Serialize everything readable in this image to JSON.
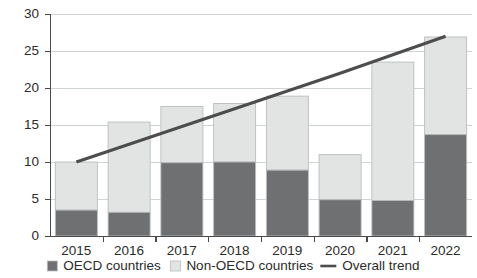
{
  "chart_data": {
    "type": "bar",
    "subtype": "stacked-bar-with-line",
    "title": "",
    "xlabel": "",
    "ylabel": "",
    "categories": [
      "2015",
      "2016",
      "2017",
      "2018",
      "2019",
      "2020",
      "2021",
      "2022"
    ],
    "series": [
      {
        "name": "OECD countries",
        "color": "#6e7072",
        "stack": "total",
        "values": [
          3.5,
          3.2,
          9.9,
          10.0,
          8.9,
          4.9,
          4.8,
          13.7
        ]
      },
      {
        "name": "Non-OECD countries",
        "color": "#e2e4e3",
        "stack": "total",
        "values": [
          6.5,
          12.2,
          7.6,
          7.9,
          10.0,
          6.1,
          18.7,
          13.2
        ]
      },
      {
        "name": "Overall trend",
        "type": "line",
        "color": "#4d4d4d",
        "values": [
          10.0,
          12.4,
          14.8,
          17.2,
          19.6,
          22.0,
          24.5,
          27.0
        ]
      }
    ],
    "totals": [
      10.0,
      15.4,
      17.5,
      17.9,
      18.9,
      11.0,
      23.5,
      26.9
    ],
    "yticks": [
      0,
      5,
      10,
      15,
      20,
      25,
      30
    ],
    "ytick_labels": [
      "0",
      "5",
      "10",
      "15",
      "20",
      "25",
      "30"
    ],
    "ylim": [
      0,
      30
    ],
    "grid": "horizontal",
    "legend_position": "bottom",
    "legend": [
      {
        "label": "OECD countries",
        "marker": "square",
        "color": "#6e7072"
      },
      {
        "label": "Non-OECD countries",
        "marker": "square",
        "color": "#e2e4e3"
      },
      {
        "label": "Overall trend",
        "marker": "line",
        "color": "#4d4d4d"
      }
    ]
  },
  "colors": {
    "oecd": "#6e7072",
    "non_oecd": "#e2e4e3",
    "trend": "#4d4d4d",
    "gridline": "#cfd4d6",
    "axis": "#4a4a4a",
    "text": "#2b2b2b",
    "background": "#ffffff"
  }
}
